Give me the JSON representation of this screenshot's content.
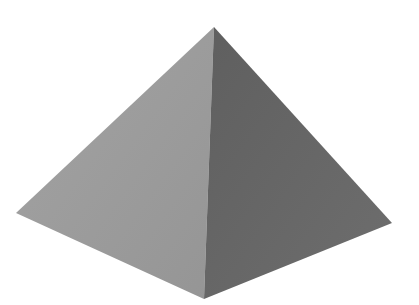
{
  "image": {
    "subject": "square pyramid",
    "description": "Gray 3D square pyramid on white background, light left face and dark right face",
    "background_color": "#ffffff",
    "faces": [
      {
        "name": "left-face",
        "color": "#9b9b9b",
        "points": "214,27 16,213 204,299"
      },
      {
        "name": "right-face",
        "color": "#676767",
        "points": "214,27 204,299 392,223"
      }
    ],
    "vertices": {
      "apex": [
        214,
        27
      ],
      "left": [
        16,
        213
      ],
      "front": [
        204,
        299
      ],
      "right": [
        392,
        223
      ]
    }
  }
}
